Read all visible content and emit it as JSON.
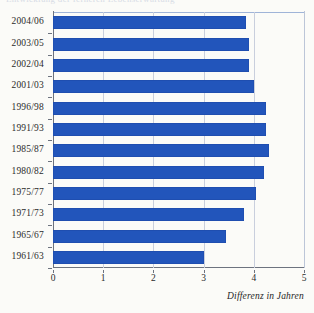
{
  "figure": {
    "top_cropped_text": "Entwicklung der ferneren Lebenserwartung",
    "axis_caption": "Differenz in Jahren",
    "bar_color": "#2255BB",
    "gridline_color": "#C9CFDD",
    "axis_color": "#6D737F",
    "background_color": "#FBFBF8"
  },
  "chart_data": {
    "type": "bar",
    "orientation": "horizontal",
    "title": "",
    "xlabel": "Differenz in Jahren",
    "ylabel": "",
    "xlim": [
      0,
      5
    ],
    "xticks": [
      0,
      1,
      2,
      3,
      4,
      5
    ],
    "xtick_labels": [
      "0",
      "1",
      "2",
      "3",
      "4",
      "5"
    ],
    "grid": true,
    "grid_axis": "x",
    "legend": false,
    "categories": [
      "2004/06",
      "2003/05",
      "2002/04",
      "2001/03",
      "1996/98",
      "1991/93",
      "1985/87",
      "1980/82",
      "1975/77",
      "1971/73",
      "1965/67",
      "1961/63"
    ],
    "values": [
      3.85,
      3.9,
      3.9,
      4.0,
      4.25,
      4.25,
      4.3,
      4.2,
      4.05,
      3.8,
      3.45,
      3.0
    ],
    "series": [
      {
        "name": "Differenz in Jahren",
        "color": "#2255BB",
        "values": [
          3.85,
          3.9,
          3.9,
          4.0,
          4.25,
          4.25,
          4.3,
          4.2,
          4.05,
          3.8,
          3.45,
          3.0
        ]
      }
    ]
  }
}
